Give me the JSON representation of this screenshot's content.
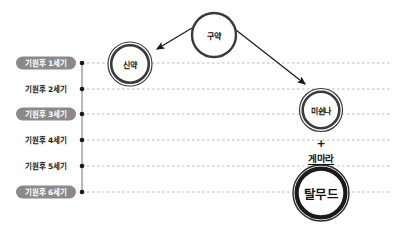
{
  "diagram": {
    "background_color": "#ffffff",
    "axis_color": "#8a8a8a",
    "gridline_color": "#b4b4b4",
    "tick_color": "#1a1a1a",
    "pill_fill_color": "#8a8a8a",
    "pill_text_color": "#ffffff",
    "label_text_color": "#1a1a1a",
    "ring_color": "#3a3a3a",
    "arrow_color": "#1a1a1a"
  },
  "timeline": {
    "axis_label": "연대축",
    "rows": [
      {
        "label": "기원후 1세기",
        "y": 63,
        "highlighted": true
      },
      {
        "label": "기원후 2세기",
        "y": 89,
        "highlighted": false
      },
      {
        "label": "기원후 3세기",
        "y": 114,
        "highlighted": true
      },
      {
        "label": "기원후 4세기",
        "y": 140,
        "highlighted": false
      },
      {
        "label": "기원후 5세기",
        "y": 166,
        "highlighted": false
      },
      {
        "label": "기원후 6세기",
        "y": 192,
        "highlighted": true
      }
    ]
  },
  "nodes": [
    {
      "id": "old-testament",
      "label": "구약",
      "cx": 214,
      "cy": 35,
      "radius": 22,
      "style": "single-ring",
      "size": "small"
    },
    {
      "id": "new-testament",
      "label": "신약",
      "cx": 130,
      "cy": 64,
      "radius": 22,
      "style": "double-ring",
      "size": "small"
    },
    {
      "id": "mishnah",
      "label": "미쉰나",
      "cx": 321,
      "cy": 110,
      "radius": 21.5,
      "style": "double-ring",
      "size": "small"
    },
    {
      "id": "talmud",
      "label": "탈무드",
      "cx": 321,
      "cy": 193,
      "radius": 28,
      "style": "double-ring-bold",
      "size": "large"
    }
  ],
  "connectors": [
    {
      "id": "old-to-new",
      "label": "구약 → 신약",
      "x1": 192,
      "y1": 28,
      "x2": 157,
      "y2": 49
    },
    {
      "id": "old-to-mishnah",
      "label": "구약 → 미쉰나",
      "x1": 236,
      "y1": 30,
      "x2": 305,
      "y2": 84
    }
  ],
  "annotations": {
    "plus": {
      "symbol": "+",
      "cx": 321,
      "cy": 143
    },
    "gemara": {
      "label": "게마라",
      "cx": 321,
      "cy": 158
    }
  },
  "gridline": {
    "x_start": 82,
    "x_end": 390
  },
  "axis": {
    "x": 82,
    "y_top": 63,
    "y_bottom": 192
  }
}
